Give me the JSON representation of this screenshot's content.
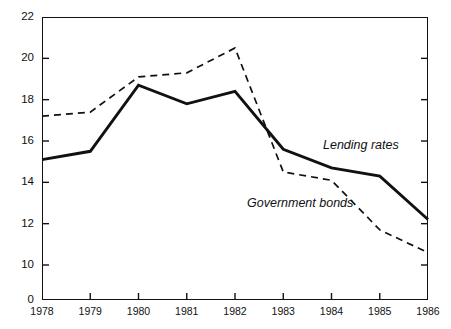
{
  "chart_data": {
    "type": "line",
    "title": "",
    "xlabel": "",
    "ylabel": "",
    "x": [
      1978,
      1979,
      1980,
      1981,
      1982,
      1983,
      1984,
      1985,
      1986
    ],
    "categories": [
      "1978",
      "1979",
      "1980",
      "1981",
      "1982",
      "1983",
      "1984",
      "1985",
      "1986"
    ],
    "ylim": [
      0,
      22
    ],
    "ytick_labels": [
      "22",
      "20",
      "18",
      "16",
      "14",
      "12",
      "10",
      "0"
    ],
    "ytick_values": [
      22,
      20,
      18,
      16,
      14,
      12,
      10,
      0
    ],
    "axis_break": true,
    "grid": false,
    "legend_position": "inline-annotation",
    "series": [
      {
        "name": "Lending rates",
        "style": "solid",
        "color": "#111111",
        "values": [
          15.1,
          15.5,
          18.7,
          17.8,
          18.4,
          15.6,
          14.7,
          14.3,
          12.2
        ]
      },
      {
        "name": "Government bonds",
        "style": "dashed",
        "color": "#111111",
        "values": [
          17.2,
          17.4,
          19.1,
          19.3,
          20.5,
          14.5,
          14.1,
          11.7,
          10.6
        ]
      }
    ],
    "annotations": [
      {
        "text": "Lending rates",
        "x_px": 323,
        "y_px": 145
      },
      {
        "text": "Government bonds",
        "x_px": 247,
        "y_px": 203
      }
    ]
  }
}
